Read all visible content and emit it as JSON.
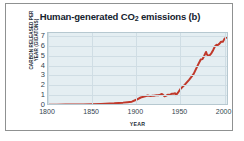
{
  "figure": {
    "panel_letter": "(b)",
    "frame_color": "#8f9191",
    "page_background": "#ffffff"
  },
  "chart_data": {
    "type": "line",
    "title_main": "Human-generated CO",
    "title_sub": "2",
    "title_tail": " emissions (b)",
    "title": "Human-generated CO2 emissions (b)",
    "xlabel": "YEAR",
    "ylabel_line1": "CARBON RELEASED PER",
    "ylabel_line2": "YEAR (GIGATONS)",
    "ylabel": "CARBON RELEASED PER YEAR (GIGATONS)",
    "xlim": [
      1800,
      2005
    ],
    "ylim": [
      0,
      7.4
    ],
    "xticks": [
      1800,
      1850,
      1900,
      1950,
      2000
    ],
    "xtick_labels": [
      "1800",
      "1850",
      "1900",
      "1950",
      "2000"
    ],
    "yticks": [
      0,
      1,
      2,
      3,
      4,
      5,
      6,
      7
    ],
    "ytick_labels": [
      "0",
      "1",
      "2",
      "3",
      "4",
      "5",
      "6",
      "7"
    ],
    "grid": true,
    "legend": null,
    "line_color": "#c0392b",
    "line_width": 2.0,
    "plot_background": "#e4eef2",
    "grid_color": "#cfdde4",
    "series": [
      {
        "name": "Carbon released per year",
        "x": [
          1800,
          1810,
          1820,
          1830,
          1840,
          1850,
          1860,
          1870,
          1875,
          1880,
          1885,
          1890,
          1895,
          1900,
          1905,
          1910,
          1913,
          1916,
          1918,
          1920,
          1923,
          1925,
          1927,
          1929,
          1930,
          1932,
          1934,
          1936,
          1938,
          1940,
          1942,
          1944,
          1945,
          1947,
          1950,
          1955,
          1960,
          1965,
          1970,
          1973,
          1975,
          1977,
          1979,
          1980,
          1982,
          1983,
          1985,
          1987,
          1989,
          1991,
          1992,
          1994,
          1996,
          1998,
          2000,
          2002
        ],
        "y": [
          0.03,
          0.03,
          0.04,
          0.05,
          0.06,
          0.08,
          0.11,
          0.15,
          0.17,
          0.21,
          0.24,
          0.29,
          0.34,
          0.53,
          0.76,
          0.88,
          0.96,
          0.9,
          0.93,
          0.94,
          1.0,
          0.99,
          1.05,
          1.12,
          1.05,
          0.88,
          0.95,
          1.05,
          1.02,
          1.14,
          1.15,
          1.18,
          1.0,
          1.22,
          1.62,
          2.07,
          2.58,
          3.15,
          4.09,
          4.61,
          4.65,
          5.0,
          5.38,
          5.12,
          4.96,
          5.03,
          5.24,
          5.56,
          5.93,
          6.1,
          6.06,
          6.2,
          6.41,
          6.4,
          6.73,
          6.82
        ]
      }
    ],
    "annotations": []
  }
}
